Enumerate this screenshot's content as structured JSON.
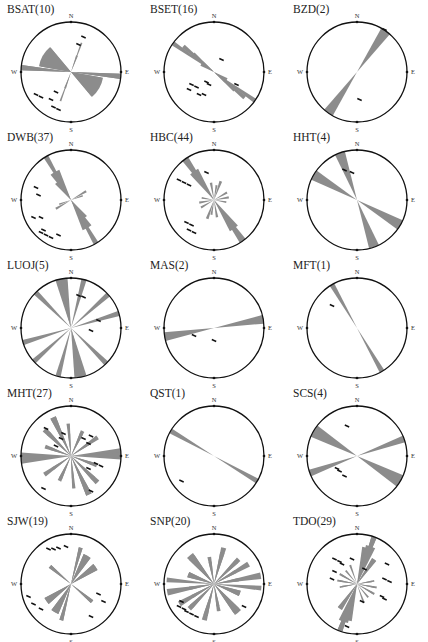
{
  "chart_data": {
    "type": "rose",
    "colors": {
      "petal": "#8c8c8c",
      "circle": "#111111",
      "marker": "#111111",
      "text": "#222222"
    },
    "direction_labels": {
      "n": "N",
      "e": "E",
      "s": "S",
      "w": "W"
    },
    "bin_width_deg": 10,
    "roses": [
      {
        "name": "BSAT",
        "count": 10,
        "label": "BSAT(10)",
        "bins": [
          {
            "az": 20,
            "r": 0.35,
            "w": 6
          },
          {
            "az": 20,
            "r": 0.62,
            "w": 3
          },
          {
            "az": 300,
            "r": 0.62,
            "w": 40
          },
          {
            "az": 275,
            "r": 1.0,
            "w": 6
          },
          {
            "az": 95,
            "r": 1.0,
            "w": 6
          },
          {
            "az": 120,
            "r": 0.65,
            "w": 40
          }
        ],
        "markers": [
          [
            0.25,
            -0.7
          ],
          [
            0.15,
            -0.55
          ],
          [
            -0.7,
            0.45
          ],
          [
            -0.6,
            0.5
          ],
          [
            -0.4,
            0.55
          ],
          [
            -0.35,
            0.7
          ],
          [
            -0.3,
            0.4
          ],
          [
            -0.25,
            0.75
          ]
        ]
      },
      {
        "name": "BSET",
        "count": 16,
        "label": "BSET(16)",
        "bins": [
          {
            "az": 125,
            "r": 0.3,
            "w": 20
          },
          {
            "az": 130,
            "r": 0.55,
            "w": 10
          },
          {
            "az": 130,
            "r": 0.8,
            "w": 6
          },
          {
            "az": 125,
            "r": 1.0,
            "w": 5
          }
        ],
        "markers": [
          [
            0.15,
            -0.25
          ],
          [
            -0.15,
            0.2
          ],
          [
            -0.1,
            0.25
          ],
          [
            -0.45,
            0.25
          ],
          [
            -0.35,
            0.3
          ],
          [
            -0.5,
            0.35
          ],
          [
            -0.3,
            0.45
          ],
          [
            -0.2,
            0.45
          ],
          [
            0.45,
            0.25
          ]
        ]
      },
      {
        "name": "BZD",
        "count": 2,
        "label": "BZD(2)",
        "bins": [
          {
            "az": 35,
            "r": 1.0,
            "w": 12
          }
        ],
        "markers": [
          [
            0.05,
            0.55
          ],
          [
            0.55,
            -0.85
          ]
        ]
      },
      {
        "name": "DWB",
        "count": 37,
        "label": "DWB(37)",
        "bins": [
          {
            "az": 150,
            "r": 0.65,
            "w": 18
          },
          {
            "az": 150,
            "r": 1.0,
            "w": 6
          },
          {
            "az": 145,
            "r": 0.45,
            "w": 20
          },
          {
            "az": 60,
            "r": 0.35,
            "w": 8
          },
          {
            "az": 70,
            "r": 0.25,
            "w": 8
          }
        ],
        "markers": [
          [
            -0.7,
            -0.25
          ],
          [
            -0.65,
            -0.1
          ],
          [
            -0.75,
            0.35
          ],
          [
            -0.6,
            0.35
          ],
          [
            -0.55,
            0.6
          ],
          [
            -0.6,
            0.65
          ],
          [
            -0.5,
            0.7
          ],
          [
            -0.4,
            0.75
          ],
          [
            -0.25,
            0.7
          ]
        ]
      },
      {
        "name": "HBC",
        "count": 44,
        "label": "HBC(44)",
        "bins": [
          {
            "az": 145,
            "r": 1.0,
            "w": 8
          },
          {
            "az": 145,
            "r": 0.7,
            "w": 16
          },
          {
            "az": 20,
            "r": 0.4,
            "w": 8
          },
          {
            "az": 60,
            "r": 0.3,
            "w": 8
          },
          {
            "az": 80,
            "r": 0.3,
            "w": 8
          },
          {
            "az": 100,
            "r": 0.25,
            "w": 8
          },
          {
            "az": 170,
            "r": 0.35,
            "w": 8
          },
          {
            "az": 190,
            "r": 0.3,
            "w": 8
          }
        ],
        "markers": [
          [
            -0.7,
            -0.4
          ],
          [
            -0.6,
            -0.35
          ],
          [
            -0.5,
            -0.3
          ],
          [
            -0.55,
            0.45
          ],
          [
            -0.45,
            0.5
          ],
          [
            -0.5,
            0.6
          ],
          [
            -0.4,
            0.65
          ],
          [
            -0.15,
            -0.55
          ]
        ]
      },
      {
        "name": "HHT",
        "count": 4,
        "label": "HHT(4)",
        "bins": [
          {
            "az": 160,
            "r": 1.0,
            "w": 12
          },
          {
            "az": 120,
            "r": 1.0,
            "w": 12
          }
        ],
        "markers": [
          [
            -0.25,
            -0.6
          ],
          [
            -0.1,
            -0.55
          ]
        ]
      },
      {
        "name": "LUOJ",
        "count": 5,
        "label": "LUOJ(5)",
        "bins": [
          {
            "az": 170,
            "r": 1.0,
            "w": 12
          },
          {
            "az": 165,
            "r": 1.0,
            "w": 6
          },
          {
            "az": 135,
            "r": 1.0,
            "w": 6
          },
          {
            "az": 73,
            "r": 1.0,
            "w": 6
          },
          {
            "az": 48,
            "r": 1.0,
            "w": 6
          },
          {
            "az": 15,
            "r": 1.0,
            "w": 6
          }
        ],
        "markers": [
          [
            0.15,
            -0.65
          ],
          [
            0.25,
            -0.62
          ],
          [
            0.55,
            -0.15
          ],
          [
            0.4,
            0.05
          ]
        ]
      },
      {
        "name": "MAS",
        "count": 2,
        "label": "MAS(2)",
        "bins": [
          {
            "az": 80,
            "r": 1.0,
            "w": 10
          }
        ],
        "markers": [
          [
            -0.4,
            0.15
          ],
          [
            0.0,
            0.25
          ]
        ]
      },
      {
        "name": "MFT",
        "count": 1,
        "label": "MFT(1)",
        "bins": [
          {
            "az": 150,
            "r": 1.0,
            "w": 6
          }
        ],
        "markers": [
          [
            -0.5,
            -0.45
          ]
        ]
      },
      {
        "name": "MHT",
        "count": 27,
        "label": "MHT(27)",
        "bins": [
          {
            "az": 85,
            "r": 1.0,
            "w": 8
          },
          {
            "az": 270,
            "r": 1.0,
            "w": 8
          },
          {
            "az": 155,
            "r": 0.85,
            "w": 8
          },
          {
            "az": 335,
            "r": 0.85,
            "w": 8
          },
          {
            "az": 135,
            "r": 0.65,
            "w": 8
          },
          {
            "az": 315,
            "r": 0.75,
            "w": 8
          },
          {
            "az": 175,
            "r": 0.65,
            "w": 6
          },
          {
            "az": 355,
            "r": 0.45,
            "w": 6
          },
          {
            "az": 205,
            "r": 0.55,
            "w": 8
          },
          {
            "az": 25,
            "r": 0.5,
            "w": 8
          },
          {
            "az": 235,
            "r": 0.65,
            "w": 8
          },
          {
            "az": 55,
            "r": 0.45,
            "w": 8
          },
          {
            "az": 110,
            "r": 0.45,
            "w": 8
          },
          {
            "az": 290,
            "r": 0.55,
            "w": 8
          }
        ],
        "markers": [
          [
            -0.5,
            -0.55
          ],
          [
            -0.15,
            -0.45
          ],
          [
            -0.2,
            -0.35
          ],
          [
            -0.3,
            -0.2
          ],
          [
            0.25,
            -0.35
          ],
          [
            0.4,
            -0.4
          ],
          [
            0.35,
            -0.25
          ],
          [
            0.5,
            0.15
          ],
          [
            0.6,
            0.2
          ],
          [
            0.35,
            0.25
          ],
          [
            -0.55,
            0.65
          ],
          [
            0.4,
            0.7
          ]
        ]
      },
      {
        "name": "QST",
        "count": 1,
        "label": "QST(1)",
        "bins": [
          {
            "az": 120,
            "r": 1.0,
            "w": 6
          }
        ],
        "markers": [
          [
            -0.65,
            0.5
          ]
        ]
      },
      {
        "name": "SCS",
        "count": 4,
        "label": "SCS(4)",
        "bins": [
          {
            "az": 120,
            "r": 1.0,
            "w": 15
          },
          {
            "az": 70,
            "r": 1.0,
            "w": 8
          }
        ],
        "markers": [
          [
            -0.2,
            -0.6
          ],
          [
            -0.4,
            0.25
          ],
          [
            -0.35,
            0.3
          ],
          [
            -0.25,
            0.4
          ]
        ]
      },
      {
        "name": "SJW",
        "count": 19,
        "label": "SJW(19)",
        "bins": [
          {
            "az": 30,
            "r": 0.65,
            "w": 14
          },
          {
            "az": 55,
            "r": 0.6,
            "w": 14
          },
          {
            "az": 15,
            "r": 0.75,
            "w": 6
          },
          {
            "az": 210,
            "r": 0.65,
            "w": 14
          },
          {
            "az": 235,
            "r": 0.6,
            "w": 14
          },
          {
            "az": 195,
            "r": 0.75,
            "w": 6
          },
          {
            "az": 130,
            "r": 0.55,
            "w": 8
          },
          {
            "az": 310,
            "r": 0.55,
            "w": 8
          }
        ],
        "markers": [
          [
            -0.45,
            -0.7
          ],
          [
            -0.35,
            -0.7
          ],
          [
            -0.25,
            -0.72
          ],
          [
            -0.1,
            -0.75
          ],
          [
            -0.85,
            0.25
          ],
          [
            -0.75,
            0.4
          ],
          [
            -0.6,
            0.5
          ],
          [
            0.55,
            0.2
          ],
          [
            0.65,
            0.35
          ],
          [
            0.4,
            0.65
          ]
        ]
      },
      {
        "name": "SNP",
        "count": 20,
        "label": "SNP(20)",
        "bins": [
          {
            "az": 15,
            "r": 0.75,
            "w": 8
          },
          {
            "az": 195,
            "r": 0.65,
            "w": 8
          },
          {
            "az": 45,
            "r": 0.7,
            "w": 8
          },
          {
            "az": 225,
            "r": 0.65,
            "w": 8
          },
          {
            "az": 60,
            "r": 0.8,
            "w": 8
          },
          {
            "az": 240,
            "r": 0.5,
            "w": 8
          },
          {
            "az": 80,
            "r": 0.95,
            "w": 8
          },
          {
            "az": 260,
            "r": 0.5,
            "w": 8
          },
          {
            "az": 110,
            "r": 0.55,
            "w": 12
          },
          {
            "az": 290,
            "r": 0.55,
            "w": 12
          },
          {
            "az": 140,
            "r": 0.75,
            "w": 12
          },
          {
            "az": 320,
            "r": 0.7,
            "w": 12
          },
          {
            "az": 170,
            "r": 0.55,
            "w": 8
          },
          {
            "az": 350,
            "r": 0.45,
            "w": 8
          },
          {
            "az": 275,
            "r": 0.95,
            "w": 6
          }
        ],
        "markers": [
          [
            -0.65,
            0.35
          ],
          [
            -0.7,
            0.45
          ],
          [
            -0.6,
            0.5
          ],
          [
            -0.55,
            0.55
          ],
          [
            -0.45,
            0.6
          ],
          [
            -0.35,
            0.65
          ],
          [
            0.6,
            0.45
          ]
        ]
      },
      {
        "name": "TDO",
        "count": 29,
        "label": "TDO(29)",
        "bins": [
          {
            "az": 20,
            "r": 1.0,
            "w": 6
          },
          {
            "az": 15,
            "r": 0.75,
            "w": 14
          },
          {
            "az": 35,
            "r": 0.6,
            "w": 8
          },
          {
            "az": 200,
            "r": 1.0,
            "w": 6
          },
          {
            "az": 200,
            "r": 0.8,
            "w": 14
          },
          {
            "az": 215,
            "r": 0.6,
            "w": 10
          },
          {
            "az": 280,
            "r": 0.4,
            "w": 6
          },
          {
            "az": 300,
            "r": 0.35,
            "w": 6
          },
          {
            "az": 100,
            "r": 0.35,
            "w": 6
          },
          {
            "az": 120,
            "r": 0.4,
            "w": 6
          },
          {
            "az": 140,
            "r": 0.35,
            "w": 6
          },
          {
            "az": 160,
            "r": 0.4,
            "w": 6
          },
          {
            "az": 260,
            "r": 0.35,
            "w": 6
          },
          {
            "az": 80,
            "r": 0.3,
            "w": 6
          }
        ],
        "markers": [
          [
            -0.45,
            -0.5
          ],
          [
            -0.35,
            -0.45
          ],
          [
            -0.3,
            -0.4
          ],
          [
            0.15,
            -0.3
          ],
          [
            -0.1,
            -0.5
          ],
          [
            -0.45,
            -0.25
          ],
          [
            -0.5,
            -0.1
          ],
          [
            0.6,
            -0.4
          ],
          [
            0.55,
            -0.1
          ],
          [
            0.65,
            -0.05
          ],
          [
            0.5,
            0.25
          ],
          [
            0.55,
            0.3
          ],
          [
            0.1,
            0.35
          ],
          [
            -0.2,
            0.85
          ]
        ]
      }
    ]
  }
}
